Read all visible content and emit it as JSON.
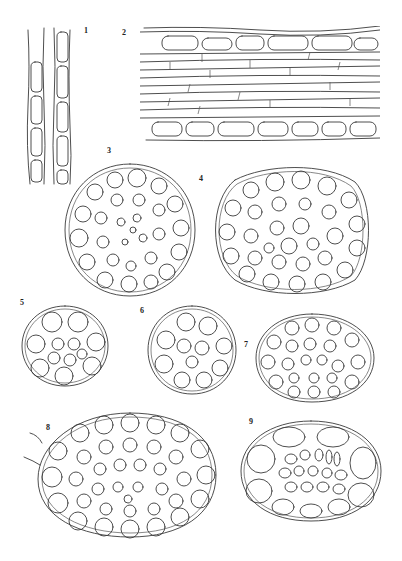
{
  "plate": {
    "type": "botanical line-drawing plate",
    "ink_color": "#3a3a3a",
    "background": "#ffffff"
  },
  "figures": [
    {
      "id": 1,
      "label": "1",
      "description": "longitudinal view of elongated rectangular cells in two columns"
    },
    {
      "id": 2,
      "label": "2",
      "description": "longitudinal section, elongated cells with rounded epidermal cells at top and bottom rows"
    },
    {
      "id": 3,
      "label": "3",
      "description": "circular cross-section with many small rounded cells"
    },
    {
      "id": 4,
      "label": "4",
      "description": "broad ovate cross-section with many rounded cells"
    },
    {
      "id": 5,
      "label": "5",
      "description": "small round cross-section, about 13 cells"
    },
    {
      "id": 6,
      "label": "6",
      "description": "small round cross-section, about 14 cells"
    },
    {
      "id": 7,
      "label": "7",
      "description": "oval cross-section with many small cells"
    },
    {
      "id": 8,
      "label": "8",
      "description": "large elliptical cross-section with many cells and attached lateral filament"
    },
    {
      "id": 9,
      "label": "9",
      "description": "elliptical cross-section with large outer cells and small central cells"
    }
  ]
}
